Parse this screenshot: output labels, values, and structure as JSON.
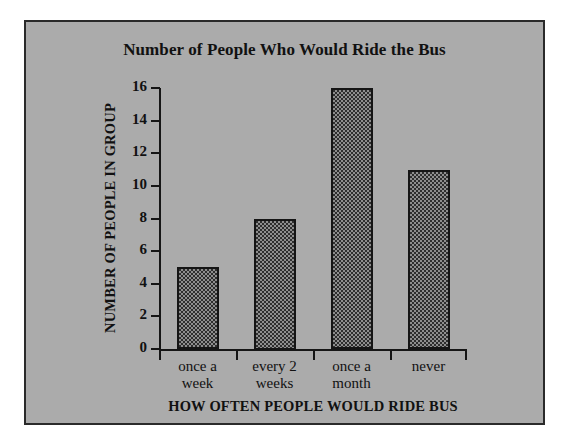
{
  "chart_data": {
    "type": "bar",
    "title": "Number of People Who Would Ride the Bus",
    "xlabel": "HOW OFTEN PEOPLE WOULD RIDE BUS",
    "ylabel": "NUMBER OF PEOPLE IN GROUP",
    "categories": [
      "once a week",
      "every 2 weeks",
      "once a month",
      "never"
    ],
    "category_lines": [
      {
        "line1": "once a",
        "line2": "week"
      },
      {
        "line1": "every 2",
        "line2": "weeks"
      },
      {
        "line1": "once a",
        "line2": "month"
      },
      {
        "line1": "never",
        "line2": ""
      }
    ],
    "values": [
      5,
      8,
      16,
      11
    ],
    "ylim": [
      0,
      16
    ],
    "ytick_step": 2,
    "yticks": [
      0,
      2,
      4,
      6,
      8,
      10,
      12,
      14,
      16
    ],
    "ytick_labels": [
      "0",
      "2",
      "4",
      "6",
      "8",
      "10",
      "12",
      "14",
      "16"
    ],
    "grid": false,
    "legend": null,
    "colors": {
      "panel_background": "#ababab",
      "panel_border": "#2a2a2a",
      "page_background": "#ffffff",
      "axis": "#151515",
      "text": "#111111",
      "bar_fill_dark": "#2e2e2e",
      "bar_fill_light": "#8e8e8e",
      "bar_outline": "#151515"
    }
  }
}
